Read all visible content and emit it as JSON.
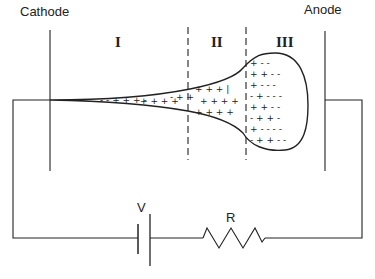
{
  "labels": {
    "cathode": "Cathode",
    "anode": "Anode",
    "region_1": "I",
    "region_2": "II",
    "region_3": "III",
    "voltage": "V",
    "resistor": "R"
  },
  "colors": {
    "line": "#222222",
    "background": "#ffffff"
  }
}
